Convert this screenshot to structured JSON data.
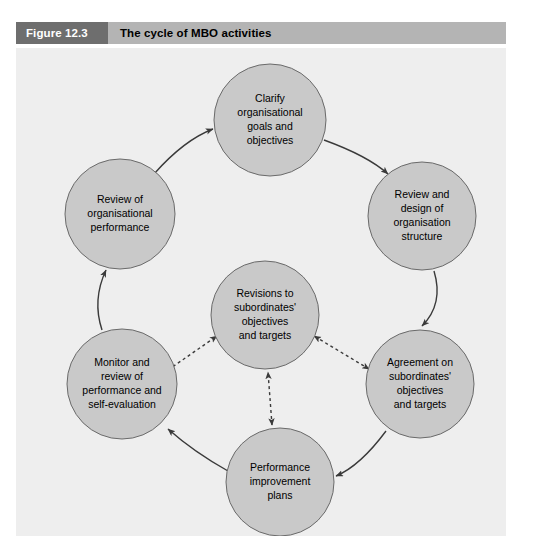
{
  "header": {
    "figure_number": "Figure 12.3",
    "figure_title": "The cycle of MBO activities",
    "number_box_color": "#6e6e6e",
    "title_bar_color": "#b4b4b4"
  },
  "diagram": {
    "panel_background": "#eeeeee",
    "node_fill": "#c9c9c9",
    "node_stroke": "#6a6a6a",
    "arrow_color": "#3a3a3a",
    "center_node": {
      "id": "revisions",
      "lines": [
        "Revisions to",
        "subordinates'",
        "objectives",
        "and targets"
      ],
      "cx": 249,
      "cy": 267,
      "r": 54
    },
    "cycle_nodes": [
      {
        "id": "clarify-goals",
        "lines": [
          "Clarify",
          "organisational",
          "goals and",
          "objectives"
        ],
        "cx": 254,
        "cy": 72,
        "r": 56
      },
      {
        "id": "review-design-structure",
        "lines": [
          "Review and",
          "design of",
          "organisation",
          "structure"
        ],
        "cx": 406,
        "cy": 168,
        "r": 54
      },
      {
        "id": "agreement-subordinates",
        "lines": [
          "Agreement on",
          "subordinates'",
          "objectives",
          "and targets"
        ],
        "cx": 404,
        "cy": 336,
        "r": 54
      },
      {
        "id": "performance-improvement",
        "lines": [
          "Performance",
          "improvement",
          "plans"
        ],
        "cx": 264,
        "cy": 434,
        "r": 54
      },
      {
        "id": "monitor-review",
        "lines": [
          "Monitor and",
          "review of",
          "performance and",
          "self-evaluation"
        ],
        "cx": 106,
        "cy": 336,
        "r": 55
      },
      {
        "id": "review-organisational-performance",
        "lines": [
          "Review of",
          "organisational",
          "performance"
        ],
        "cx": 104,
        "cy": 166,
        "r": 55
      }
    ],
    "cycle_direction": "clockwise",
    "dashed_links": [
      {
        "id": "monitor-to-revisions",
        "from": "monitor-review",
        "to": "revisions",
        "style": "double-headed-dashed"
      },
      {
        "id": "agreement-to-revisions",
        "from": "agreement-subordinates",
        "to": "revisions",
        "style": "double-headed-dashed"
      },
      {
        "id": "performance-plans-to-revisions",
        "from": "performance-improvement",
        "to": "revisions",
        "style": "double-headed-dashed"
      }
    ]
  }
}
